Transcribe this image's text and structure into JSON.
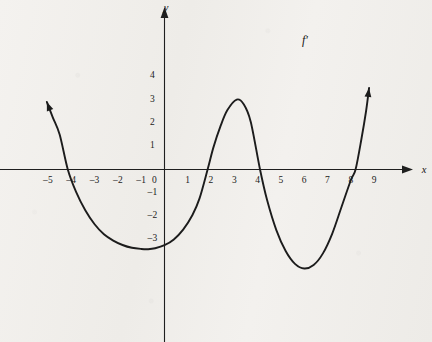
{
  "figure": {
    "background_color": "#f1efec",
    "ink_color": "#1a1a1a",
    "width": 432,
    "height": 342
  },
  "axes": {
    "x_axis_label": "x",
    "y_axis_label": "y",
    "origin_label": "0",
    "x_tick_labels": [
      "–5",
      "–4",
      "–3",
      "–2",
      "–1",
      "1",
      "2",
      "3",
      "4",
      "5",
      "6",
      "7",
      "8",
      "9"
    ],
    "x_tick_values": [
      -5,
      -4,
      -3,
      -2,
      -1,
      1,
      2,
      3,
      4,
      5,
      6,
      7,
      8,
      9
    ],
    "y_tick_labels": [
      "4",
      "3",
      "2",
      "1",
      "–1",
      "–2",
      "–3"
    ],
    "y_tick_values": [
      4,
      3,
      2,
      1,
      -1,
      -2,
      -3
    ]
  },
  "curve": {
    "label": "f′",
    "label_x": 6.0,
    "label_y": 5.7
  },
  "chart_data": {
    "type": "line",
    "title": "",
    "xlabel": "x",
    "ylabel": "y",
    "xlim": [
      -6.2,
      10.4
    ],
    "ylim": [
      -6.5,
      7.0
    ],
    "grid": false,
    "legend": null,
    "annotations": [
      {
        "text": "f′",
        "x": 6.0,
        "y": 5.7,
        "note": "curve name label for the derivative graph"
      }
    ],
    "axis_arrows": {
      "x_positive": true,
      "y_positive": true
    },
    "series": [
      {
        "name": "f'",
        "arrow_start": true,
        "arrow_end": true,
        "x_range": [
          -5.05,
          8.78
        ],
        "key_points": {
          "x_intercepts": [
            -4.15,
            1.85,
            4.1,
            8.2
          ],
          "local_minima": [
            {
              "x": -0.7,
              "y": -3.4
            },
            {
              "x": 6.0,
              "y": -4.25
            }
          ],
          "local_maxima": [
            {
              "x": 3.1,
              "y": 3.0
            }
          ],
          "endpoints": [
            {
              "x": -5.05,
              "y": 2.9
            },
            {
              "x": 8.78,
              "y": 3.5
            }
          ]
        },
        "points": [
          {
            "x": -5.05,
            "y": 2.9
          },
          {
            "x": -4.8,
            "y": 2.25
          },
          {
            "x": -4.5,
            "y": 1.5
          },
          {
            "x": -4.15,
            "y": 0.0
          },
          {
            "x": -3.8,
            "y": -0.95
          },
          {
            "x": -3.4,
            "y": -1.75
          },
          {
            "x": -3.0,
            "y": -2.35
          },
          {
            "x": -2.6,
            "y": -2.78
          },
          {
            "x": -2.2,
            "y": -3.05
          },
          {
            "x": -1.8,
            "y": -3.24
          },
          {
            "x": -1.4,
            "y": -3.36
          },
          {
            "x": -1.0,
            "y": -3.41
          },
          {
            "x": -0.7,
            "y": -3.42
          },
          {
            "x": -0.4,
            "y": -3.38
          },
          {
            "x": 0.0,
            "y": -3.25
          },
          {
            "x": 0.4,
            "y": -3.0
          },
          {
            "x": 0.8,
            "y": -2.58
          },
          {
            "x": 1.2,
            "y": -1.95
          },
          {
            "x": 1.5,
            "y": -1.25
          },
          {
            "x": 1.85,
            "y": 0.0
          },
          {
            "x": 2.1,
            "y": 0.95
          },
          {
            "x": 2.4,
            "y": 1.85
          },
          {
            "x": 2.7,
            "y": 2.55
          },
          {
            "x": 3.1,
            "y": 3.0
          },
          {
            "x": 3.4,
            "y": 2.8
          },
          {
            "x": 3.7,
            "y": 2.05
          },
          {
            "x": 4.1,
            "y": 0.0
          },
          {
            "x": 4.4,
            "y": -1.3
          },
          {
            "x": 4.8,
            "y": -2.6
          },
          {
            "x": 5.2,
            "y": -3.5
          },
          {
            "x": 5.6,
            "y": -4.05
          },
          {
            "x": 6.0,
            "y": -4.25
          },
          {
            "x": 6.4,
            "y": -4.1
          },
          {
            "x": 6.8,
            "y": -3.6
          },
          {
            "x": 7.2,
            "y": -2.75
          },
          {
            "x": 7.6,
            "y": -1.6
          },
          {
            "x": 8.0,
            "y": -0.45
          },
          {
            "x": 8.2,
            "y": 0.0
          },
          {
            "x": 8.45,
            "y": 1.3
          },
          {
            "x": 8.65,
            "y": 2.5
          },
          {
            "x": 8.78,
            "y": 3.5
          }
        ]
      }
    ]
  }
}
